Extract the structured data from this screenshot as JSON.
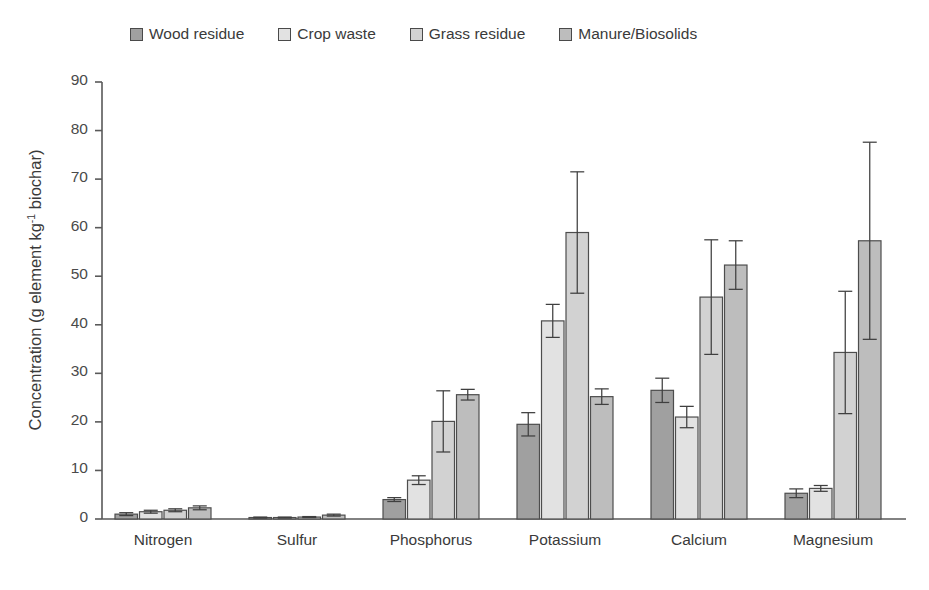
{
  "chart_data": {
    "type": "bar",
    "title": "",
    "xlabel": "",
    "ylabel": "Concentration (g element kg-1 biochar)",
    "ylabel_prefix": "Concentration (g element kg",
    "ylabel_sup": "-1",
    "ylabel_suffix": " biochar)",
    "ylim": [
      0,
      90
    ],
    "ytick_step": 10,
    "yticks": [
      0,
      10,
      20,
      30,
      40,
      50,
      60,
      70,
      80,
      90
    ],
    "grid": false,
    "legend_position": "top",
    "categories": [
      "Nitrogen",
      "Sulfur",
      "Phosphorus",
      "Potassium",
      "Calcium",
      "Magnesium"
    ],
    "series": [
      {
        "name": "Wood residue",
        "color": "#a0a0a0",
        "values": [
          1.0,
          0.3,
          4.0,
          19.5,
          26.5,
          5.3
        ],
        "errors": [
          0.3,
          0.1,
          0.4,
          2.4,
          2.5,
          0.9
        ]
      },
      {
        "name": "Crop waste",
        "color": "#e2e2e2",
        "values": [
          1.5,
          0.3,
          8.0,
          40.8,
          21.0,
          6.3
        ],
        "errors": [
          0.3,
          0.1,
          0.9,
          3.4,
          2.2,
          0.6
        ]
      },
      {
        "name": "Grass residue",
        "color": "#d2d2d2",
        "values": [
          1.8,
          0.4,
          20.1,
          59.0,
          45.7,
          34.3
        ],
        "errors": [
          0.3,
          0.1,
          6.3,
          12.5,
          11.8,
          12.6
        ]
      },
      {
        "name": "Manure/Biosolids",
        "color": "#bdbdbd",
        "values": [
          2.3,
          0.8,
          25.6,
          25.2,
          52.3,
          57.3
        ],
        "errors": [
          0.4,
          0.2,
          1.1,
          1.6,
          5.0,
          20.3
        ]
      }
    ]
  },
  "legend": {
    "items": [
      {
        "label": "Wood residue"
      },
      {
        "label": "Crop waste"
      },
      {
        "label": "Grass residue"
      },
      {
        "label": "Manure/Biosolids"
      }
    ]
  },
  "axis": {
    "y_tick_labels": [
      "90",
      "80",
      "70",
      "60",
      "50",
      "40",
      "30",
      "20",
      "10",
      "0"
    ],
    "x_tick_labels": [
      "Nitrogen",
      "Sulfur",
      "Phosphorus",
      "Potassium",
      "Calcium",
      "Magnesium"
    ]
  }
}
